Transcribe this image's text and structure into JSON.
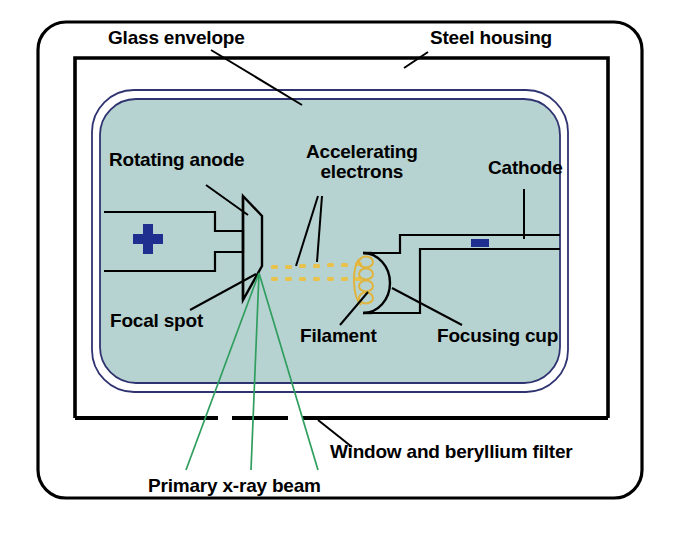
{
  "figure": {
    "background_color": "#ffffff"
  },
  "colors": {
    "housing_outline": "#000000",
    "glass_envelope_line": "#2f3470",
    "vacuum_fill": "#b7d3d1",
    "charge_symbol": "#1f2f8f",
    "filament_gold": "#e0b43c",
    "electron_gold": "#e8c24a",
    "xray_beam_green": "#2f9e5e",
    "leader_line": "#000000"
  },
  "labels": {
    "glass_envelope": "Glass envelope",
    "steel_housing": "Steel housing",
    "rotating_anode": "Rotating anode",
    "accelerating_electrons_line1": "Accelerating",
    "accelerating_electrons_line2": "electrons",
    "cathode": "Cathode",
    "focal_spot": "Focal spot",
    "filament": "Filament",
    "focusing_cup": "Focusing cup",
    "window_beryllium_filter": "Window and beryllium filter",
    "primary_xray_beam": "Primary x-ray beam"
  },
  "symbols": {
    "anode_polarity": "+",
    "cathode_polarity": "-"
  },
  "components": [
    {
      "name": "outer-case",
      "label": "Steel housing",
      "kind": "rounded-rectangle"
    },
    {
      "name": "steel-housing",
      "label": "Steel housing",
      "kind": "rectangle"
    },
    {
      "name": "glass-envelope",
      "label": "Glass envelope",
      "kind": "rounded-rectangle-double-line"
    },
    {
      "name": "vacuum-region",
      "label": "Vacuum",
      "kind": "fill"
    },
    {
      "name": "rotating-anode",
      "label": "Rotating anode",
      "kind": "angled-disc"
    },
    {
      "name": "anode-stem",
      "label": "Anode stem and rotor",
      "kind": "rectangle"
    },
    {
      "name": "focal-spot",
      "label": "Focal spot",
      "kind": "point"
    },
    {
      "name": "accelerating-electrons",
      "label": "Accelerating electrons",
      "kind": "dot-stream"
    },
    {
      "name": "filament",
      "label": "Filament",
      "kind": "coil"
    },
    {
      "name": "focusing-cup",
      "label": "Focusing cup",
      "kind": "half-circle"
    },
    {
      "name": "cathode",
      "label": "Cathode",
      "kind": "stepped-block"
    },
    {
      "name": "window",
      "label": "Window and beryllium filter",
      "kind": "gap-in-housing"
    },
    {
      "name": "primary-beam",
      "label": "Primary x-ray beam",
      "kind": "ray-fan"
    }
  ]
}
